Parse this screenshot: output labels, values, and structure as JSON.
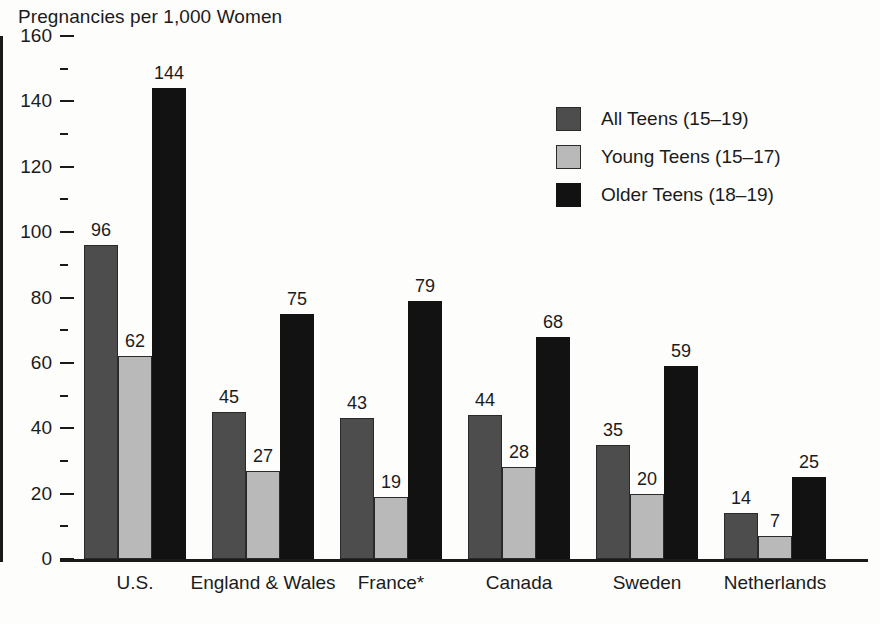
{
  "chart_data": {
    "type": "bar",
    "title": "Pregnancies per 1,000 Women",
    "xlabel": "",
    "ylabel": "",
    "ylim": [
      0,
      160
    ],
    "ytick_step": 20,
    "yminor_step": 10,
    "grid": false,
    "legend_position": "upper-right",
    "categories": [
      "U.S.",
      "England & Wales",
      "France*",
      "Canada",
      "Sweden",
      "Netherlands"
    ],
    "ytick_labels": [
      "0",
      "20",
      "40",
      "60",
      "80",
      "100",
      "120",
      "140",
      "160"
    ],
    "series": [
      {
        "name": "All Teens (15–19)",
        "key": "all",
        "color": "#4d4d4d",
        "values": [
          96,
          45,
          43,
          44,
          35,
          14
        ]
      },
      {
        "name": "Young Teens (15–17)",
        "key": "young",
        "color": "#b9b9b9",
        "values": [
          62,
          27,
          19,
          28,
          20,
          7
        ]
      },
      {
        "name": "Older Teens (18–19)",
        "key": "older",
        "color": "#121212",
        "values": [
          144,
          75,
          79,
          68,
          59,
          25
        ]
      }
    ]
  }
}
